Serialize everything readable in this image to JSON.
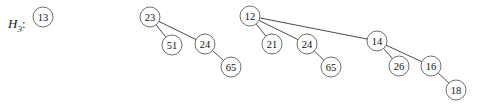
{
  "figure": {
    "label": "H",
    "label_subscript": "3",
    "label_colon": ":",
    "background_color": "#ffffff",
    "node_stroke_color": "#5f5f5f",
    "edge_color": "#2b2b2b",
    "text_color": "#101010",
    "node_radius": 10
  },
  "trees": [
    {
      "name": "binomial-tree-0",
      "root_key": "13",
      "nodes": [
        {
          "id": "t0-13",
          "key": "13",
          "cx": 43,
          "cy": 17
        }
      ],
      "edges": []
    },
    {
      "name": "binomial-tree-1",
      "root_key": "23",
      "nodes": [
        {
          "id": "t1-23",
          "key": "23",
          "cx": 150,
          "cy": 17
        },
        {
          "id": "t1-51",
          "key": "51",
          "cx": 172,
          "cy": 45
        },
        {
          "id": "t1-24",
          "key": "24",
          "cx": 205,
          "cy": 44
        },
        {
          "id": "t1-65",
          "key": "65",
          "cx": 231,
          "cy": 67
        }
      ],
      "edges": [
        {
          "from": "t1-23",
          "to": "t1-51"
        },
        {
          "from": "t1-23",
          "to": "t1-24"
        },
        {
          "from": "t1-24",
          "to": "t1-65"
        }
      ]
    },
    {
      "name": "binomial-tree-2",
      "root_key": "12",
      "nodes": [
        {
          "id": "t2-12",
          "key": "12",
          "cx": 250,
          "cy": 16
        },
        {
          "id": "t2-21",
          "key": "21",
          "cx": 272,
          "cy": 44
        },
        {
          "id": "t2-24",
          "key": "24",
          "cx": 307,
          "cy": 44
        },
        {
          "id": "t2-65",
          "key": "65",
          "cx": 331,
          "cy": 67
        },
        {
          "id": "t2-14",
          "key": "14",
          "cx": 377,
          "cy": 41
        },
        {
          "id": "t2-26",
          "key": "26",
          "cx": 399,
          "cy": 66
        },
        {
          "id": "t2-16",
          "key": "16",
          "cx": 431,
          "cy": 66
        },
        {
          "id": "t2-18",
          "key": "18",
          "cx": 456,
          "cy": 90
        }
      ],
      "edges": [
        {
          "from": "t2-12",
          "to": "t2-21"
        },
        {
          "from": "t2-12",
          "to": "t2-24"
        },
        {
          "from": "t2-12",
          "to": "t2-14"
        },
        {
          "from": "t2-24",
          "to": "t2-65"
        },
        {
          "from": "t2-14",
          "to": "t2-26"
        },
        {
          "from": "t2-14",
          "to": "t2-16"
        },
        {
          "from": "t2-16",
          "to": "t2-18"
        }
      ]
    }
  ]
}
